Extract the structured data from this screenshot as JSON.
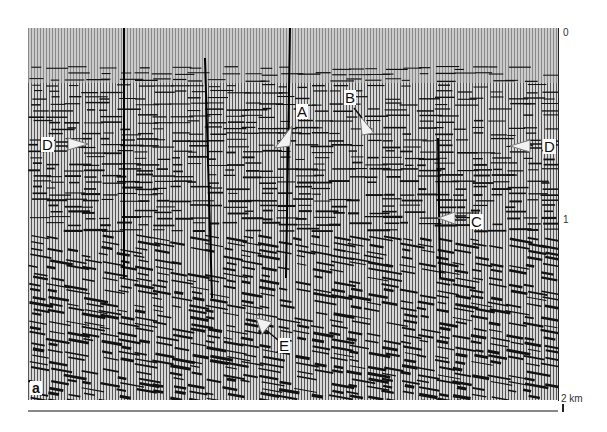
{
  "figure": {
    "panel_label": "a",
    "axis": {
      "ticks": [
        {
          "label": "0",
          "y": 33
        },
        {
          "label": "1",
          "y": 220
        },
        {
          "label": "2 km",
          "y": 398
        }
      ]
    },
    "markers": [
      {
        "id": "A",
        "label": "A"
      },
      {
        "id": "B",
        "label": "B"
      },
      {
        "id": "C",
        "label": "C"
      },
      {
        "id": "D-left",
        "label": "D"
      },
      {
        "id": "D-right",
        "label": "D"
      },
      {
        "id": "E",
        "label": "E"
      }
    ],
    "colors": {
      "ink": "#111111",
      "paper": "#ffffff",
      "marker_fill": "#f2f2f2"
    }
  }
}
